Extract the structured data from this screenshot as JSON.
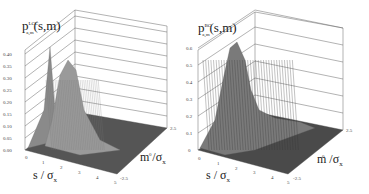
{
  "figure": {
    "left": {
      "title_main": "p",
      "title_sup": "LCC",
      "title_sub": "a,m",
      "title_args": "(s,m)",
      "xlabel_main": "s / σ",
      "xlabel_sub": "x",
      "ylabel_main": "m /σ",
      "ylabel_sub": "x"
    },
    "right": {
      "title_main": "p",
      "title_sup": "BC",
      "title_sub": "a,m",
      "title_args": "(s,m)",
      "xlabel_main": "s / σ",
      "xlabel_sub": "x",
      "ylabel_main": "m /σ",
      "ylabel_sub": "x"
    }
  },
  "chart_data": [
    {
      "type": "surface",
      "title": "p^LCC_a,m(s,m)",
      "xlabel": "s / σx",
      "ylabel": "m / σx",
      "zlabel": "p^LCC_a,m(s,m)",
      "x_ticks": [
        "0",
        "1",
        "2",
        "3",
        "4",
        "5"
      ],
      "y_ticks": [
        "-2.5",
        "0",
        "2.5"
      ],
      "z_ticks": [
        "0.00",
        "0.05",
        "0.10",
        "0.15",
        "0.20",
        "0.25",
        "0.30",
        "0.35",
        "0.40"
      ],
      "xlim": [
        0,
        5
      ],
      "ylim": [
        -2.5,
        2.5
      ],
      "zlim": [
        0,
        0.45
      ],
      "peaks": [
        {
          "description": "sharp narrow ridge near s≈0.5, m≈2.5 edge",
          "s": 0.5,
          "height": 0.4
        },
        {
          "description": "broad peak near s≈1, m≈0",
          "s": 1.0,
          "m": 0,
          "height": 0.3
        }
      ],
      "grid": true
    },
    {
      "type": "surface",
      "title": "p^BC_a,m(s,m)",
      "xlabel": "s / σx",
      "ylabel": "m / σx",
      "zlabel": "p^BC_a,m(s,m)",
      "x_ticks": [
        "0",
        "1",
        "2",
        "3",
        "4",
        "5"
      ],
      "y_ticks": [
        "-2.5",
        "0",
        "2.5"
      ],
      "z_ticks": [
        "0",
        "0.1",
        "0.2",
        "0.3",
        "0.4",
        "0.5",
        "0.6"
      ],
      "xlim": [
        0,
        5
      ],
      "ylim": [
        -2.5,
        2.5
      ],
      "zlim": [
        0,
        0.65
      ],
      "peaks": [
        {
          "description": "single peak near s≈1, m≈2.5 edge",
          "s": 1.0,
          "height": 0.63
        }
      ],
      "grid": true
    }
  ]
}
